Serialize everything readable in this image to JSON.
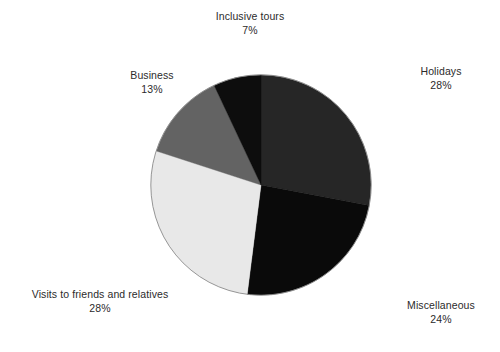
{
  "chart_data": {
    "type": "pie",
    "title": "",
    "subtitle": "",
    "xlabel": "",
    "ylabel": "",
    "legend_position": "none",
    "grid": false,
    "labels_outside": true,
    "start_angle_deg": 0,
    "direction": "clockwise",
    "categories": [
      "Holidays",
      "Miscellaneous",
      "Visits to friends and relatives",
      "Business",
      "Inclusive tours"
    ],
    "values": [
      28,
      24,
      28,
      13,
      7
    ],
    "value_suffix": "%",
    "slices": [
      {
        "name": "Holidays",
        "value": 28,
        "value_text": "28%",
        "color": "#262626",
        "start_deg": 0,
        "end_deg": 100.8
      },
      {
        "name": "Miscellaneous",
        "value": 24,
        "value_text": "24%",
        "color": "#0a0a0a",
        "start_deg": 100.8,
        "end_deg": 187.2
      },
      {
        "name": "Visits to friends and relatives",
        "value": 28,
        "value_text": "28%",
        "color": "#e8e8e8",
        "start_deg": 187.2,
        "end_deg": 288.0
      },
      {
        "name": "Business",
        "value": 13,
        "value_text": "13%",
        "color": "#636363",
        "start_deg": 288.0,
        "end_deg": 334.8
      },
      {
        "name": "Inclusive tours",
        "value": 7,
        "value_text": "7%",
        "color": "#0d0d0d",
        "start_deg": 334.8,
        "end_deg": 360.0
      }
    ]
  },
  "labels": {
    "inclusive_tours": {
      "name": "Inclusive tours",
      "pct": "7%"
    },
    "business": {
      "name": "Business",
      "pct": "13%"
    },
    "holidays": {
      "name": "Holidays",
      "pct": "28%"
    },
    "visits": {
      "name": "Visits to friends and relatives",
      "pct": "28%"
    },
    "miscellaneous": {
      "name": "Miscellaneous",
      "pct": "24%"
    }
  },
  "colors": {
    "background": "#ffffff",
    "text": "#2b2b2b",
    "outline": "#8a8a8a",
    "holidays": "#262626",
    "miscellaneous": "#0a0a0a",
    "visits": "#e8e8e8",
    "business": "#636363",
    "inclusive_tours": "#0d0d0d"
  }
}
